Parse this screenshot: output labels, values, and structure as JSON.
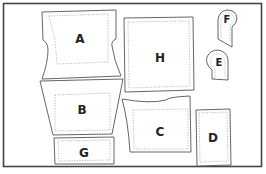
{
  "diagram": {
    "type": "sewing-pattern-layout",
    "border_color": "#444444",
    "outline_color": "#555555",
    "stitch_color": "#aaaaaa",
    "pieces": [
      {
        "id": "A",
        "label": "A"
      },
      {
        "id": "B",
        "label": "B"
      },
      {
        "id": "C",
        "label": "C"
      },
      {
        "id": "D",
        "label": "D"
      },
      {
        "id": "E",
        "label": "E"
      },
      {
        "id": "F",
        "label": "F"
      },
      {
        "id": "G",
        "label": "G"
      },
      {
        "id": "H",
        "label": "H"
      }
    ]
  }
}
